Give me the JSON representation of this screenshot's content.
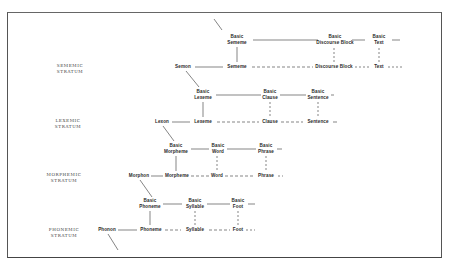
{
  "diagram": {
    "type": "stratificational-hierarchy",
    "strata": [
      {
        "id": "sememic",
        "label_line1": "SEMEMIC",
        "label_line2": "STRATUM",
        "etic": "Semon",
        "emic": [
          "Sememe",
          "Discourse Block",
          "Text"
        ],
        "basic": [
          [
            "Basic",
            "Sememe"
          ],
          [
            "Basic",
            "Discourse Block"
          ],
          [
            "Basic",
            "Text"
          ]
        ]
      },
      {
        "id": "lexemic",
        "label_line1": "LEXEMIC",
        "label_line2": "STRATUM",
        "etic": "Lexon",
        "emic": [
          "Lexeme",
          "Clause",
          "Sentence"
        ],
        "basic": [
          [
            "Basic",
            "Lexeme"
          ],
          [
            "Basic",
            "Clause"
          ],
          [
            "Basic",
            "Sentence"
          ]
        ]
      },
      {
        "id": "morphemic",
        "label_line1": "MORPHEMIC",
        "label_line2": "STRATUM",
        "etic": "Morphon",
        "emic": [
          "Morpheme",
          "Word",
          "Phrase"
        ],
        "basic": [
          [
            "Basic",
            "Morpheme"
          ],
          [
            "Basic",
            "Word"
          ],
          [
            "Basic",
            "Phrase"
          ]
        ]
      },
      {
        "id": "phonemic",
        "label_line1": "PHONEMIC",
        "label_line2": "STRATUM",
        "etic": "Phonon",
        "emic": [
          "Phoneme",
          "Syllable",
          "Foot"
        ],
        "basic": [
          [
            "Basic",
            "Phoneme"
          ],
          [
            "Basic",
            "Syllable"
          ],
          [
            "Basic",
            "Foot"
          ]
        ]
      }
    ],
    "colors": {
      "ink": "#2a2a2a",
      "frame": "#555555",
      "background": "#ffffff"
    }
  }
}
